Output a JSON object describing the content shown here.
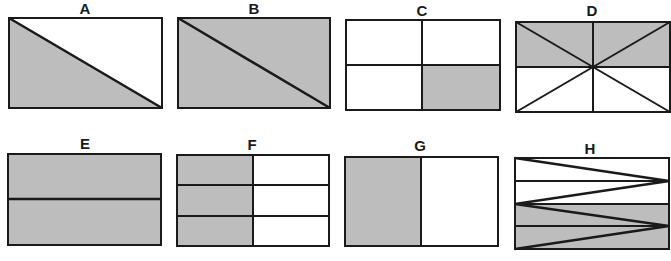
{
  "colors": {
    "shade": "#bdbdbd",
    "line": "#1a1a1a",
    "background": "#ffffff"
  },
  "panels": [
    {
      "id": "A",
      "label": "A",
      "description": "Rectangle split by diagonal from top-left to bottom-right; lower-left triangle shaded",
      "shaded_fraction": "1/2"
    },
    {
      "id": "B",
      "label": "B",
      "description": "Rectangle split by diagonal from top-left to bottom-right; both triangles shaded",
      "shaded_fraction": "2/2"
    },
    {
      "id": "C",
      "label": "C",
      "description": "Rectangle divided into 4 quadrants; bottom-right quadrant shaded",
      "shaded_fraction": "1/4"
    },
    {
      "id": "D",
      "label": "D",
      "description": "Rectangle divided into 8 triangles by midlines and diagonals; top half shaded",
      "shaded_fraction": "4/8"
    },
    {
      "id": "E",
      "label": "E",
      "description": "Rectangle split horizontally into 2 halves; both shaded",
      "shaded_fraction": "2/2"
    },
    {
      "id": "F",
      "label": "F",
      "description": "Rectangle divided into 6 parts (2 columns x 3 rows); left column shaded",
      "shaded_fraction": "3/6"
    },
    {
      "id": "G",
      "label": "G",
      "description": "Rectangle split vertically into 2 halves; left half shaded",
      "shaded_fraction": "1/2"
    },
    {
      "id": "H",
      "label": "H",
      "description": "Rectangle with 4 horizontal strips and zigzag diagonals; bottom half shaded",
      "shaded_fraction": "4/8"
    }
  ]
}
